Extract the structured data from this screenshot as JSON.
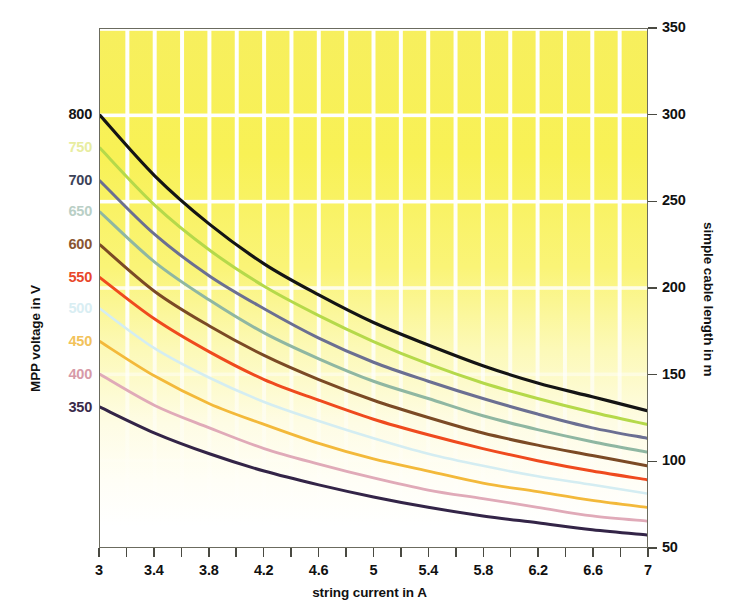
{
  "chart_data": {
    "type": "line",
    "title": "",
    "xlabel": "string current in A",
    "ylabel": "MPP voltage in V",
    "y2label": "simple cable length in m",
    "xlim": [
      3,
      7
    ],
    "ylim": [
      50,
      350
    ],
    "grid": true,
    "legend": "none (curves labelled at left axis)",
    "x_ticks": [
      "3",
      "3.4",
      "3.8",
      "4.2",
      "4.6",
      "5",
      "5.4",
      "5.8",
      "6.2",
      "6.6",
      "7"
    ],
    "x_tick_values": [
      3,
      3.4,
      3.8,
      4.2,
      4.6,
      5,
      5.4,
      5.8,
      6.2,
      6.6,
      7
    ],
    "x_minor_step": 0.2,
    "y_right_ticks": [
      "350",
      "300",
      "250",
      "200",
      "150",
      "100",
      "50"
    ],
    "y_right_tick_values": [
      350,
      300,
      250,
      200,
      150,
      100,
      50
    ],
    "y_left_labels": [
      {
        "label": "800",
        "value": 800,
        "color": "#141414"
      },
      {
        "label": "750",
        "value": 750,
        "color": "#e8eda0"
      },
      {
        "label": "700",
        "value": 700,
        "color": "#3c4258"
      },
      {
        "label": "650",
        "value": 650,
        "color": "#b9cfc6"
      },
      {
        "label": "600",
        "value": 600,
        "color": "#8a5530"
      },
      {
        "label": "550",
        "value": 550,
        "color": "#e8472a"
      },
      {
        "label": "500",
        "value": 500,
        "color": "#d9eef3"
      },
      {
        "label": "450",
        "value": 450,
        "color": "#f2c25a"
      },
      {
        "label": "400",
        "value": 400,
        "color": "#d79aa7"
      },
      {
        "label": "350",
        "value": 350,
        "color": "#3a2a4a"
      }
    ],
    "series": [
      {
        "name": "800 V",
        "color": "#141414",
        "width": 3.2,
        "x": [
          3,
          3.4,
          3.8,
          4.2,
          4.6,
          5,
          5.4,
          5.8,
          6.2,
          6.6,
          7
        ],
        "values": [
          300,
          265,
          237,
          214,
          196,
          180,
          167,
          155,
          145,
          137,
          129
        ]
      },
      {
        "name": "750 V",
        "color": "#b5d94a",
        "width": 3.0,
        "x": [
          3,
          3.4,
          3.8,
          4.2,
          4.6,
          5,
          5.4,
          5.8,
          6.2,
          6.6,
          7
        ],
        "values": [
          281,
          248,
          222,
          201,
          184,
          169,
          156,
          145,
          136,
          128,
          121
        ]
      },
      {
        "name": "700 V",
        "color": "#6b6f92",
        "width": 3.0,
        "x": [
          3,
          3.4,
          3.8,
          4.2,
          4.6,
          5,
          5.4,
          5.8,
          6.2,
          6.6,
          7
        ],
        "values": [
          262,
          231,
          207,
          188,
          171,
          157,
          146,
          136,
          127,
          119,
          113
        ]
      },
      {
        "name": "650 V",
        "color": "#8fb7a2",
        "width": 3.0,
        "x": [
          3,
          3.4,
          3.8,
          4.2,
          4.6,
          5,
          5.4,
          5.8,
          6.2,
          6.6,
          7
        ],
        "values": [
          244,
          215,
          193,
          174,
          159,
          146,
          136,
          126,
          118,
          111,
          105
        ]
      },
      {
        "name": "600 V",
        "color": "#7b4a25",
        "width": 3.0,
        "x": [
          3,
          3.4,
          3.8,
          4.2,
          4.6,
          5,
          5.4,
          5.8,
          6.2,
          6.6,
          7
        ],
        "values": [
          225,
          198,
          178,
          161,
          147,
          135,
          125,
          116,
          109,
          103,
          97
        ]
      },
      {
        "name": "550 V",
        "color": "#ef4a1e",
        "width": 3.0,
        "x": [
          3,
          3.4,
          3.8,
          4.2,
          4.6,
          5,
          5.4,
          5.8,
          6.2,
          6.6,
          7
        ],
        "values": [
          206,
          182,
          163,
          147,
          135,
          124,
          115,
          107,
          100,
          94,
          89
        ]
      },
      {
        "name": "500 V",
        "color": "#d4edf2",
        "width": 2.6,
        "x": [
          3,
          3.4,
          3.8,
          4.2,
          4.6,
          5,
          5.4,
          5.8,
          6.2,
          6.6,
          7
        ],
        "values": [
          188,
          165,
          148,
          134,
          123,
          113,
          104,
          97,
          91,
          86,
          81
        ]
      },
      {
        "name": "450 V",
        "color": "#f3b93a",
        "width": 2.8,
        "x": [
          3,
          3.4,
          3.8,
          4.2,
          4.6,
          5,
          5.4,
          5.8,
          6.2,
          6.6,
          7
        ],
        "values": [
          169,
          149,
          133,
          121,
          110,
          101,
          94,
          87,
          82,
          77,
          73
        ]
      },
      {
        "name": "400 V",
        "color": "#e0aab8",
        "width": 2.8,
        "x": [
          3,
          3.4,
          3.8,
          4.2,
          4.6,
          5,
          5.4,
          5.8,
          6.2,
          6.6,
          7
        ],
        "values": [
          150,
          132,
          119,
          107,
          98,
          90,
          83,
          78,
          73,
          68,
          65
        ]
      },
      {
        "name": "350 V",
        "color": "#332447",
        "width": 3.0,
        "x": [
          3,
          3.4,
          3.8,
          4.2,
          4.6,
          5,
          5.4,
          5.8,
          6.2,
          6.6,
          7
        ],
        "values": [
          131,
          116,
          104,
          94,
          86,
          79,
          73,
          68,
          64,
          60,
          57
        ]
      }
    ],
    "gridlines_y": [
      350,
      300,
      250,
      200,
      150,
      100
    ],
    "background": "yellow-to-white vertical gradient with white gridlines"
  },
  "axes": {
    "left_title": "MPP voltage in V",
    "right_title": "simple cable length in m",
    "bottom_title": "string current in A"
  }
}
